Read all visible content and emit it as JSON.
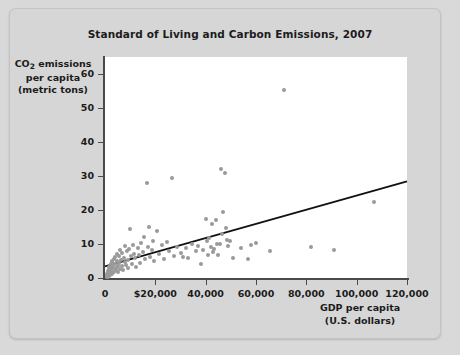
{
  "chart_data": {
    "type": "scatter",
    "title": "Standard of Living and Carbon Emissions, 2007",
    "xlabel_line1": "GDP per capita",
    "xlabel_line2": "(U.S. dollars)",
    "ylabel_line1_pre": "CO",
    "ylabel_line1_sub": "2",
    "ylabel_line1_post": " emissions",
    "ylabel_line2": "per capita",
    "ylabel_line3": "(metric tons)",
    "xlim": [
      0,
      120000
    ],
    "ylim": [
      0,
      65
    ],
    "grid": false,
    "legend": "none",
    "xticks": [
      0,
      20000,
      40000,
      60000,
      80000,
      100000,
      120000
    ],
    "xtick_labels": [
      "0",
      "$20,000",
      "40,000",
      "60,000",
      "80,000",
      "100,000",
      "120,000"
    ],
    "yticks": [
      0,
      10,
      20,
      30,
      40,
      50,
      60
    ],
    "ytick_labels": [
      "0",
      "10",
      "20",
      "30",
      "40",
      "50",
      "60"
    ],
    "point_color": "#9a9a9a",
    "trendline_color": "#111111",
    "trendline": {
      "x0": 0,
      "y0": 3.4,
      "x1": 120000,
      "y1": 28.4
    },
    "points": [
      [
        600,
        0.4
      ],
      [
        800,
        0.6
      ],
      [
        900,
        1.1
      ],
      [
        1000,
        0.3
      ],
      [
        1100,
        1.6
      ],
      [
        1200,
        0.9
      ],
      [
        1300,
        2.1
      ],
      [
        1400,
        1.2
      ],
      [
        1500,
        2.6
      ],
      [
        1600,
        0.7
      ],
      [
        1700,
        3.1
      ],
      [
        1800,
        1.5
      ],
      [
        1900,
        2.2
      ],
      [
        2000,
        3.6
      ],
      [
        2100,
        1.0
      ],
      [
        2200,
        4.2
      ],
      [
        2300,
        2.4
      ],
      [
        2400,
        1.7
      ],
      [
        2500,
        3.2
      ],
      [
        2600,
        5.1
      ],
      [
        2700,
        2.0
      ],
      [
        2800,
        4.6
      ],
      [
        2900,
        1.3
      ],
      [
        3000,
        3.8
      ],
      [
        3200,
        2.8
      ],
      [
        3400,
        5.6
      ],
      [
        3600,
        1.9
      ],
      [
        3800,
        4.0
      ],
      [
        4000,
        6.2
      ],
      [
        4200,
        3.0
      ],
      [
        4400,
        2.3
      ],
      [
        4600,
        5.0
      ],
      [
        4800,
        7.1
      ],
      [
        5000,
        3.4
      ],
      [
        5200,
        1.8
      ],
      [
        5400,
        6.6
      ],
      [
        5600,
        4.4
      ],
      [
        5800,
        2.7
      ],
      [
        6000,
        8.1
      ],
      [
        6300,
        5.4
      ],
      [
        6600,
        3.6
      ],
      [
        6900,
        7.4
      ],
      [
        7200,
        2.5
      ],
      [
        7500,
        6.0
      ],
      [
        7800,
        4.8
      ],
      [
        8100,
        9.3
      ],
      [
        8400,
        3.9
      ],
      [
        8700,
        7.8
      ],
      [
        9000,
        5.2
      ],
      [
        9300,
        2.9
      ],
      [
        9600,
        8.6
      ],
      [
        10000,
        14.5
      ],
      [
        10400,
        6.4
      ],
      [
        10800,
        4.1
      ],
      [
        11200,
        9.8
      ],
      [
        11600,
        7.0
      ],
      [
        12000,
        5.8
      ],
      [
        12500,
        3.3
      ],
      [
        13000,
        8.9
      ],
      [
        13500,
        6.8
      ],
      [
        14000,
        4.5
      ],
      [
        14500,
        10.2
      ],
      [
        15000,
        7.6
      ],
      [
        15500,
        12.2
      ],
      [
        16000,
        5.5
      ],
      [
        16500,
        27.8
      ],
      [
        17000,
        9.0
      ],
      [
        17500,
        15.0
      ],
      [
        18000,
        6.1
      ],
      [
        18500,
        8.3
      ],
      [
        19000,
        11.0
      ],
      [
        19500,
        4.9
      ],
      [
        20500,
        13.8
      ],
      [
        21500,
        7.2
      ],
      [
        22500,
        9.6
      ],
      [
        23500,
        5.7
      ],
      [
        24500,
        10.5
      ],
      [
        25500,
        8.0
      ],
      [
        26500,
        29.5
      ],
      [
        27500,
        6.5
      ],
      [
        28500,
        9.1
      ],
      [
        30000,
        7.3
      ],
      [
        31000,
        6.3
      ],
      [
        32000,
        8.7
      ],
      [
        33000,
        5.9
      ],
      [
        34500,
        10.0
      ],
      [
        36000,
        7.9
      ],
      [
        37000,
        9.4
      ],
      [
        38000,
        4.0
      ],
      [
        39000,
        8.2
      ],
      [
        40000,
        17.5
      ],
      [
        40500,
        10.8
      ],
      [
        41000,
        6.7
      ],
      [
        41500,
        11.8
      ],
      [
        42000,
        9.2
      ],
      [
        42500,
        15.8
      ],
      [
        43000,
        7.7
      ],
      [
        43500,
        8.5
      ],
      [
        44000,
        17.0
      ],
      [
        44500,
        10.1
      ],
      [
        45000,
        6.9
      ],
      [
        45500,
        9.9
      ],
      [
        46000,
        32.2
      ],
      [
        46500,
        12.8
      ],
      [
        47000,
        19.4
      ],
      [
        47500,
        31.0
      ],
      [
        48000,
        14.6
      ],
      [
        48500,
        11.2
      ],
      [
        49000,
        9.5
      ],
      [
        49500,
        10.9
      ],
      [
        51000,
        6.0
      ],
      [
        54000,
        8.8
      ],
      [
        57000,
        5.7
      ],
      [
        58000,
        9.6
      ],
      [
        60000,
        10.3
      ],
      [
        65500,
        7.9
      ],
      [
        71000,
        55.2
      ],
      [
        82000,
        9.2
      ],
      [
        91000,
        8.3
      ],
      [
        107000,
        22.3
      ]
    ]
  }
}
